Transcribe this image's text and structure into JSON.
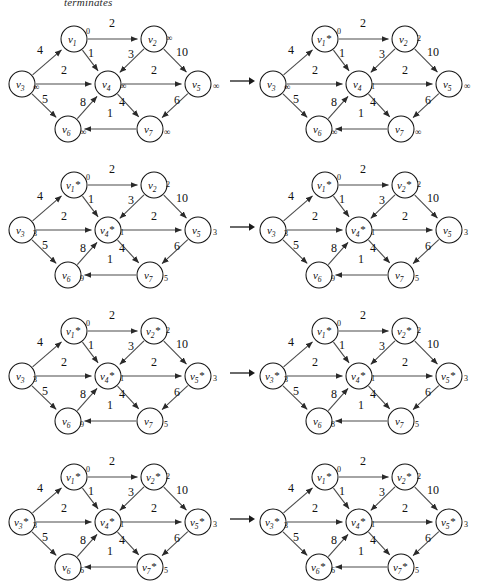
{
  "caption": "terminates",
  "graph": {
    "nodes": [
      {
        "id": "v1",
        "label": "v",
        "sub": "1",
        "x": 72,
        "y": 27
      },
      {
        "id": "v2",
        "label": "v",
        "sub": "2",
        "x": 152,
        "y": 27
      },
      {
        "id": "v3",
        "label": "v",
        "sub": "3",
        "x": 20,
        "y": 72
      },
      {
        "id": "v4",
        "label": "v",
        "sub": "4",
        "x": 106,
        "y": 72
      },
      {
        "id": "v5",
        "label": "v",
        "sub": "5",
        "x": 196,
        "y": 72
      },
      {
        "id": "v6",
        "label": "v",
        "sub": "6",
        "x": 66,
        "y": 117
      },
      {
        "id": "v7",
        "label": "v",
        "sub": "7",
        "x": 148,
        "y": 117
      }
    ],
    "edges": [
      {
        "from": "v1",
        "to": "v2",
        "weight": "2",
        "wx": 110,
        "wy": 15
      },
      {
        "from": "v3",
        "to": "v1",
        "weight": "4",
        "wx": 38,
        "wy": 42
      },
      {
        "from": "v1",
        "to": "v4",
        "weight": "1",
        "wx": 89,
        "wy": 45
      },
      {
        "from": "v2",
        "to": "v4",
        "weight": "3",
        "wx": 129,
        "wy": 46
      },
      {
        "from": "v2",
        "to": "v5",
        "weight": "10",
        "wx": 180,
        "wy": 44
      },
      {
        "from": "v3",
        "to": "v4",
        "weight": "2",
        "wx": 62,
        "wy": 62,
        "rev": true
      },
      {
        "from": "v4",
        "to": "v5",
        "weight": "2",
        "wx": 152,
        "wy": 62
      },
      {
        "from": "v3",
        "to": "v6",
        "weight": "5",
        "wx": 43,
        "wy": 91
      },
      {
        "from": "v6",
        "to": "v4",
        "weight": "8",
        "wx": 81,
        "wy": 94
      },
      {
        "from": "v4",
        "to": "v7",
        "weight": "4",
        "wx": 120,
        "wy": 94
      },
      {
        "from": "v5",
        "to": "v7",
        "weight": "6",
        "wx": 175,
        "wy": 92
      },
      {
        "from": "v7",
        "to": "v6",
        "weight": "1",
        "wx": 108,
        "wy": 105
      }
    ],
    "arrow_symbol": "→"
  },
  "panels": [
    {
      "name": "panel-1",
      "row": 0,
      "side": "left",
      "dist": {
        "v1": "0",
        "v2": "∞",
        "v3": "∞",
        "v4": "∞",
        "v5": "∞",
        "v6": "∞",
        "v7": "∞"
      },
      "starred": {
        "v1": false,
        "v2": false,
        "v3": false,
        "v4": false,
        "v5": false,
        "v6": false,
        "v7": false
      }
    },
    {
      "name": "panel-2",
      "row": 0,
      "side": "right",
      "dist": {
        "v1": "0",
        "v2": "2",
        "v3": "∞",
        "v4": "1",
        "v5": "∞",
        "v6": "∞",
        "v7": "∞"
      },
      "starred": {
        "v1": true,
        "v2": false,
        "v3": false,
        "v4": false,
        "v5": false,
        "v6": false,
        "v7": false
      }
    },
    {
      "name": "panel-3",
      "row": 1,
      "side": "left",
      "dist": {
        "v1": "0",
        "v2": "2",
        "v3": "3",
        "v4": "1",
        "v5": "3",
        "v6": "9",
        "v7": "5"
      },
      "starred": {
        "v1": true,
        "v2": false,
        "v3": false,
        "v4": true,
        "v5": false,
        "v6": false,
        "v7": false
      }
    },
    {
      "name": "panel-4",
      "row": 1,
      "side": "right",
      "dist": {
        "v1": "0",
        "v2": "2",
        "v3": "3",
        "v4": "1",
        "v5": "3",
        "v6": "9",
        "v7": "5"
      },
      "starred": {
        "v1": true,
        "v2": true,
        "v3": false,
        "v4": true,
        "v5": false,
        "v6": false,
        "v7": false
      }
    },
    {
      "name": "panel-5",
      "row": 2,
      "side": "left",
      "dist": {
        "v1": "0",
        "v2": "2",
        "v3": "3",
        "v4": "1",
        "v5": "3",
        "v6": "9",
        "v7": "5"
      },
      "starred": {
        "v1": true,
        "v2": true,
        "v3": false,
        "v4": true,
        "v5": true,
        "v6": false,
        "v7": false
      }
    },
    {
      "name": "panel-6",
      "row": 2,
      "side": "right",
      "dist": {
        "v1": "0",
        "v2": "2",
        "v3": "3",
        "v4": "1",
        "v5": "3",
        "v6": "8",
        "v7": "5"
      },
      "starred": {
        "v1": true,
        "v2": true,
        "v3": true,
        "v4": true,
        "v5": true,
        "v6": false,
        "v7": false
      }
    },
    {
      "name": "panel-7",
      "row": 3,
      "side": "left",
      "dist": {
        "v1": "0",
        "v2": "2",
        "v3": "3",
        "v4": "1",
        "v5": "3",
        "v6": "6",
        "v7": "5"
      },
      "starred": {
        "v1": true,
        "v2": true,
        "v3": true,
        "v4": true,
        "v5": true,
        "v6": false,
        "v7": true
      }
    },
    {
      "name": "panel-8",
      "row": 3,
      "side": "right",
      "dist": {
        "v1": "0",
        "v2": "2",
        "v3": "3",
        "v4": "1",
        "v5": "3",
        "v6": "6",
        "v7": "5"
      },
      "starred": {
        "v1": true,
        "v2": true,
        "v3": true,
        "v4": true,
        "v5": true,
        "v6": true,
        "v7": true
      }
    }
  ]
}
